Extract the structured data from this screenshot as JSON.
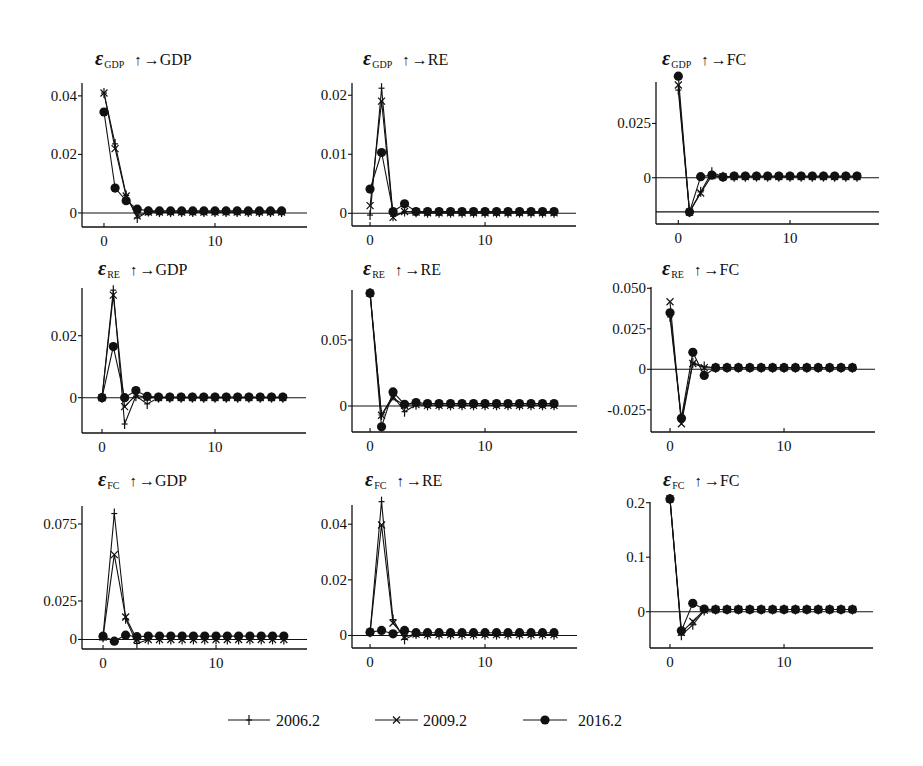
{
  "chart_data": {
    "type": "line",
    "title": "",
    "xlabel": "",
    "ylabel": "",
    "grid": false,
    "legend_position": "bottom",
    "x": [
      0,
      1,
      2,
      3,
      4,
      5,
      6,
      7,
      8,
      9,
      10,
      11,
      12,
      13,
      14,
      15,
      16
    ],
    "xticks": [
      0,
      10
    ],
    "xtick_labels": [
      "0",
      "10"
    ],
    "legend": [
      {
        "label": "2006.2",
        "marker": "plus"
      },
      {
        "label": "2009.2",
        "marker": "x"
      },
      {
        "label": "2016.2",
        "marker": "circle"
      }
    ],
    "panels": [
      {
        "id": "gdp_to_gdp",
        "title": {
          "symbol": "ε",
          "shock": "GDP",
          "shock_arrow": "↑",
          "response": "→GDP"
        },
        "xlim": [
          -1.98,
          18.29
        ],
        "ylim": [
          -0.0048,
          0.0444
        ],
        "yticks": [
          0,
          0.02,
          0.04
        ],
        "ytick_labels": [
          "0",
          "0.02",
          "0.04"
        ],
        "reference_lines": [
          0
        ],
        "series": [
          {
            "name": "2006.2",
            "values": [
              0.041,
              0.0236,
              0.006,
              -0.0017,
              0.0005,
              0.0003,
              0.0003,
              0.0003,
              0.0003,
              0.0003,
              0.0003,
              0.0003,
              0.0003,
              0.0003,
              0.0003,
              0.0003,
              0.0003
            ]
          },
          {
            "name": "2009.2",
            "values": [
              0.041,
              0.022,
              0.0058,
              -0.001,
              0.0003,
              0.0003,
              0.0003,
              0.0003,
              0.0003,
              0.0003,
              0.0003,
              0.0003,
              0.0003,
              0.0003,
              0.0003,
              0.0003,
              0.0003
            ]
          },
          {
            "name": "2016.2",
            "values": [
              0.0345,
              0.0085,
              0.0042,
              0.0013,
              0.0007,
              0.0007,
              0.0007,
              0.0007,
              0.0007,
              0.0007,
              0.0007,
              0.0007,
              0.0007,
              0.0007,
              0.0007,
              0.0007,
              0.0007
            ]
          }
        ]
      },
      {
        "id": "gdp_to_re",
        "title": {
          "symbol": "ε",
          "shock": "GDP",
          "shock_arrow": "↑",
          "response": "→RE"
        },
        "xlim": [
          -1.57,
          17.91
        ],
        "ylim": [
          -0.00215,
          0.02208
        ],
        "yticks": [
          0,
          0.01,
          0.02
        ],
        "ytick_labels": [
          "0",
          "0.01",
          "0.02"
        ],
        "reference_lines": [
          0
        ],
        "series": [
          {
            "name": "2006.2",
            "values": [
              -0.0003,
              0.0212,
              -0.0005,
              0.0003,
              0.0002,
              0.0001,
              0.0001,
              0.0001,
              0.0001,
              0.0001,
              0.0001,
              0.0001,
              0.0001,
              0.0001,
              0.0001,
              0.0001,
              0.0001
            ]
          },
          {
            "name": "2009.2",
            "values": [
              0.0013,
              0.019,
              -0.0007,
              0.0003,
              0.0002,
              0.0001,
              0.0001,
              0.0001,
              0.0001,
              0.0001,
              0.0001,
              0.0001,
              0.0001,
              0.0001,
              0.0001,
              0.0001,
              0.0001
            ]
          },
          {
            "name": "2016.2",
            "values": [
              0.0041,
              0.0103,
              0.0003,
              0.0016,
              0.0003,
              0.0003,
              0.0003,
              0.0003,
              0.0003,
              0.0003,
              0.0003,
              0.0003,
              0.0003,
              0.0003,
              0.0003,
              0.0003,
              0.0003
            ]
          }
        ]
      },
      {
        "id": "gdp_to_fc",
        "title": {
          "symbol": "ε",
          "shock": "GDP",
          "shock_arrow": "↑",
          "response": "→FC"
        },
        "xlim": [
          -2.0,
          17.97
        ],
        "ylim": [
          -0.0213,
          0.0441
        ],
        "yticks": [
          0,
          0.025
        ],
        "ytick_labels": [
          "0",
          "0.025"
        ],
        "reference_lines": [
          0,
          -0.0157
        ],
        "series": [
          {
            "name": "2006.2",
            "values": [
              0.0404,
              -0.0158,
              -0.0065,
              0.0025,
              0.0005,
              0.0005,
              0.0005,
              0.0005,
              0.0005,
              0.0005,
              0.0005,
              0.0005,
              0.0005,
              0.0005,
              0.0005,
              0.0005,
              0.0005
            ]
          },
          {
            "name": "2009.2",
            "values": [
              0.0427,
              -0.0158,
              -0.007,
              0.001,
              0.0005,
              0.0005,
              0.0005,
              0.0005,
              0.0005,
              0.0005,
              0.0005,
              0.0005,
              0.0005,
              0.0005,
              0.0005,
              0.0005,
              0.0005
            ]
          },
          {
            "name": "2016.2",
            "values": [
              0.0468,
              -0.0158,
              0.0005,
              0.0012,
              0.0003,
              0.0008,
              0.0008,
              0.0008,
              0.0008,
              0.0008,
              0.0008,
              0.0008,
              0.0008,
              0.0008,
              0.0008,
              0.0008,
              0.0008
            ]
          }
        ]
      },
      {
        "id": "re_to_gdp",
        "title": {
          "symbol": "ε",
          "shock": "RE",
          "shock_arrow": "↑",
          "response": "→GDP"
        },
        "xlim": [
          -1.77,
          18.05
        ],
        "ylim": [
          -0.0114,
          0.0354
        ],
        "yticks": [
          0,
          0.02
        ],
        "ytick_labels": [
          "0",
          "0.02"
        ],
        "reference_lines": [
          0
        ],
        "series": [
          {
            "name": "2006.2",
            "values": [
              0.0,
              0.0347,
              -0.0085,
              0.0005,
              -0.002,
              0.0,
              0.0,
              0.0,
              0.0,
              0.0,
              0.0,
              0.0,
              0.0,
              0.0,
              0.0,
              0.0,
              0.0
            ]
          },
          {
            "name": "2009.2",
            "values": [
              0.0,
              0.0331,
              -0.0029,
              0.0008,
              0.0,
              0.0,
              0.0,
              0.0,
              0.0,
              0.0,
              0.0,
              0.0,
              0.0,
              0.0,
              0.0,
              0.0,
              0.0
            ]
          },
          {
            "name": "2016.2",
            "values": [
              0.0,
              0.0165,
              0.0,
              0.0023,
              0.0004,
              0.0002,
              0.0002,
              0.0002,
              0.0002,
              0.0002,
              0.0002,
              0.0002,
              0.0002,
              0.0002,
              0.0002,
              0.0002,
              0.0002
            ]
          }
        ]
      },
      {
        "id": "re_to_re",
        "title": {
          "symbol": "ε",
          "shock": "RE",
          "shock_arrow": "↑",
          "response": "→RE"
        },
        "xlim": [
          -1.57,
          18.0
        ],
        "ylim": [
          -0.0197,
          0.0879
        ],
        "yticks": [
          0,
          0.05
        ],
        "ytick_labels": [
          "0",
          "0.05"
        ],
        "reference_lines": [
          0
        ],
        "series": [
          {
            "name": "2006.2",
            "values": [
              0.0855,
              -0.0068,
              0.008,
              -0.0043,
              0.001,
              0.0005,
              0.0005,
              0.0005,
              0.0005,
              0.0005,
              0.0005,
              0.0005,
              0.0005,
              0.0005,
              0.0005,
              0.0005,
              0.0005
            ]
          },
          {
            "name": "2009.2",
            "values": [
              0.0855,
              -0.007,
              0.006,
              0.0005,
              0.001,
              0.0005,
              0.0005,
              0.0005,
              0.0005,
              0.0005,
              0.0005,
              0.0005,
              0.0005,
              0.0005,
              0.0005,
              0.0005,
              0.0005
            ]
          },
          {
            "name": "2016.2",
            "values": [
              0.0855,
              -0.0158,
              0.0107,
              0.0013,
              0.0026,
              0.0018,
              0.0018,
              0.0018,
              0.0018,
              0.0018,
              0.0018,
              0.0018,
              0.0018,
              0.0018,
              0.0018,
              0.0018,
              0.0018
            ]
          }
        ]
      },
      {
        "id": "re_to_fc",
        "title": {
          "symbol": "ε",
          "shock": "RE",
          "shock_arrow": "↑",
          "response": "→FC"
        },
        "xlim": [
          -1.67,
          17.98
        ],
        "ylim": [
          -0.0387,
          0.0508
        ],
        "yticks": [
          -0.025,
          0,
          0.025,
          0.05
        ],
        "ytick_labels": [
          "-0.025",
          "0",
          "0.025",
          "0.050"
        ],
        "reference_lines": [
          0
        ],
        "series": [
          {
            "name": "2006.2",
            "values": [
              0.0323,
              -0.031,
              0.004,
              0.0017,
              0.001,
              0.001,
              0.001,
              0.001,
              0.001,
              0.001,
              0.001,
              0.001,
              0.001,
              0.001,
              0.001,
              0.001,
              0.001
            ]
          },
          {
            "name": "2009.2",
            "values": [
              0.0417,
              -0.0336,
              0.0036,
              0.001,
              0.001,
              0.001,
              0.001,
              0.001,
              0.001,
              0.001,
              0.001,
              0.001,
              0.001,
              0.001,
              0.001,
              0.001,
              0.001
            ]
          },
          {
            "name": "2016.2",
            "values": [
              0.0349,
              -0.0302,
              0.0105,
              -0.0038,
              0.001,
              0.001,
              0.001,
              0.001,
              0.001,
              0.001,
              0.001,
              0.001,
              0.001,
              0.001,
              0.001,
              0.001,
              0.001
            ]
          }
        ]
      },
      {
        "id": "fc_to_gdp",
        "title": {
          "symbol": "ε",
          "shock": "FC",
          "shock_arrow": "↑",
          "response": "→GDP"
        },
        "xlim": [
          -1.86,
          18.05
        ],
        "ylim": [
          -0.0062,
          0.0867
        ],
        "yticks": [
          0,
          0.025,
          0.075
        ],
        "ytick_labels": [
          "0",
          "0.025",
          "0.075"
        ],
        "reference_lines": [
          0
        ],
        "series": [
          {
            "name": "2006.2",
            "values": [
              0.0015,
              0.0818,
              0.0135,
              -0.0026,
              0.0,
              0.0,
              0.0,
              0.0,
              0.0,
              0.0,
              0.0,
              0.0,
              0.0,
              0.0,
              0.0,
              0.0,
              0.0
            ]
          },
          {
            "name": "2009.2",
            "values": [
              0.0015,
              0.0551,
              0.0146,
              0.0,
              0.0,
              0.0,
              0.0,
              0.0,
              0.0,
              0.0,
              0.0,
              0.0,
              0.0,
              0.0,
              0.0,
              0.0,
              0.0
            ]
          },
          {
            "name": "2016.2",
            "values": [
              0.0021,
              -0.0011,
              0.0028,
              0.0018,
              0.0022,
              0.0022,
              0.0022,
              0.0022,
              0.0022,
              0.0022,
              0.0022,
              0.0022,
              0.0022,
              0.0022,
              0.0022,
              0.0022,
              0.0022
            ]
          }
        ]
      },
      {
        "id": "fc_to_re",
        "title": {
          "symbol": "ε",
          "shock": "FC",
          "shock_arrow": "↑",
          "response": "→RE"
        },
        "xlim": [
          -1.57,
          18.0
        ],
        "ylim": [
          -0.0045,
          0.0469
        ],
        "yticks": [
          0,
          0.02,
          0.04
        ],
        "ytick_labels": [
          "0",
          "0.02",
          "0.04"
        ],
        "reference_lines": [
          0
        ],
        "series": [
          {
            "name": "2006.2",
            "values": [
              0.0012,
              0.0481,
              0.0057,
              -0.0014,
              0.0005,
              0.0003,
              0.0003,
              0.0003,
              0.0003,
              0.0003,
              0.0003,
              0.0003,
              0.0003,
              0.0003,
              0.0003,
              0.0003,
              0.0003
            ]
          },
          {
            "name": "2009.2",
            "values": [
              0.0012,
              0.0397,
              0.0045,
              -0.0005,
              0.0005,
              0.0003,
              0.0003,
              0.0003,
              0.0003,
              0.0003,
              0.0003,
              0.0003,
              0.0003,
              0.0003,
              0.0003,
              0.0003,
              0.0003
            ]
          },
          {
            "name": "2016.2",
            "values": [
              0.0012,
              0.0018,
              0.0006,
              0.0018,
              0.001,
              0.001,
              0.001,
              0.001,
              0.001,
              0.001,
              0.001,
              0.001,
              0.001,
              0.001,
              0.001,
              0.001,
              0.001
            ]
          }
        ]
      },
      {
        "id": "fc_to_fc",
        "title": {
          "symbol": "ε",
          "shock": "FC",
          "shock_arrow": "↑",
          "response": "→FC"
        },
        "xlim": [
          -1.75,
          17.8
        ],
        "ylim": [
          -0.0666,
          0.2013
        ],
        "yticks": [
          0,
          0.1,
          0.2
        ],
        "ytick_labels": [
          "0",
          "0.1",
          "0.2"
        ],
        "reference_lines": [
          0
        ],
        "series": [
          {
            "name": "2006.2",
            "values": [
              0.207,
              -0.043,
              -0.024,
              0.002,
              0.004,
              0.004,
              0.004,
              0.004,
              0.004,
              0.004,
              0.004,
              0.004,
              0.004,
              0.004,
              0.004,
              0.004,
              0.004
            ]
          },
          {
            "name": "2009.2",
            "values": [
              0.207,
              -0.038,
              -0.018,
              0.003,
              0.004,
              0.004,
              0.004,
              0.004,
              0.004,
              0.004,
              0.004,
              0.004,
              0.004,
              0.004,
              0.004,
              0.004,
              0.004
            ]
          },
          {
            "name": "2016.2",
            "values": [
              0.207,
              -0.035,
              0.0153,
              0.005,
              0.004,
              0.004,
              0.004,
              0.004,
              0.004,
              0.004,
              0.004,
              0.004,
              0.004,
              0.004,
              0.004,
              0.004,
              0.004
            ]
          }
        ]
      }
    ]
  },
  "colors": {
    "ink": "#111111",
    "background": "#ffffff"
  }
}
